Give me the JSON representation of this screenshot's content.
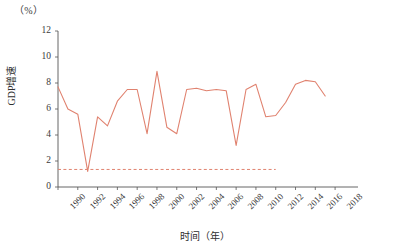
{
  "chart_data": {
    "type": "line",
    "title": "",
    "unit_label": "（%）",
    "xlabel": "时间（年）",
    "ylabel": "GDP增速",
    "ylim": [
      0,
      12
    ],
    "yticks": [
      0,
      2,
      4,
      6,
      8,
      10,
      12
    ],
    "xlim": [
      1990,
      2019
    ],
    "xticks": [
      1990,
      1992,
      1994,
      1996,
      1998,
      2000,
      2002,
      2004,
      2006,
      2008,
      2010,
      2012,
      2014,
      2016,
      2018
    ],
    "xtick_labels": [
      "1990",
      "1992",
      "1994",
      "1996",
      "1998",
      "2000",
      "2002",
      "2004",
      "2006",
      "2008",
      "2010",
      "2012",
      "2014",
      "2016",
      "2018"
    ],
    "grid": false,
    "legend": "none",
    "line_color": "#e0826f",
    "x": [
      1990,
      1991,
      1992,
      1993,
      1994,
      1995,
      1996,
      1997,
      1998,
      1999,
      2000,
      2001,
      2002,
      2003,
      2004,
      2005,
      2006,
      2007,
      2008,
      2009,
      2010,
      2011,
      2012,
      2013,
      2014,
      2015,
      2016,
      2017
    ],
    "series": [
      {
        "name": "GDP增速",
        "values": [
          7.7,
          6.0,
          5.6,
          1.2,
          5.4,
          4.7,
          6.6,
          7.5,
          7.5,
          4.1,
          8.9,
          4.6,
          4.1,
          7.5,
          7.6,
          7.4,
          7.5,
          7.4,
          3.2,
          7.5,
          7.9,
          5.4,
          5.5,
          6.5,
          7.9,
          8.2,
          8.1,
          7.0
        ]
      }
    ],
    "reference_line": {
      "name": "基准线",
      "value": 1.35,
      "x_start": 1990,
      "x_end": 2012,
      "style": "dashed",
      "color": "#e0826f"
    }
  }
}
